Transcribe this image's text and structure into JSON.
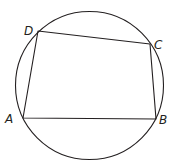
{
  "diagram": {
    "type": "cyclic-quadrilateral",
    "stroke_color": "#231f20",
    "circle": {
      "cx": 89.5,
      "cy": 85.5,
      "r": 74
    },
    "vertices": [
      {
        "name": "A",
        "x": 23,
        "y": 118,
        "label_x": 5,
        "label_y": 123
      },
      {
        "name": "B",
        "x": 156,
        "y": 119,
        "label_x": 159,
        "label_y": 124
      },
      {
        "name": "C",
        "x": 150,
        "y": 44,
        "label_x": 154,
        "label_y": 49
      },
      {
        "name": "D",
        "x": 38,
        "y": 31,
        "label_x": 24,
        "label_y": 35
      }
    ],
    "labels": {
      "A": "A",
      "B": "B",
      "C": "C",
      "D": "D"
    }
  }
}
